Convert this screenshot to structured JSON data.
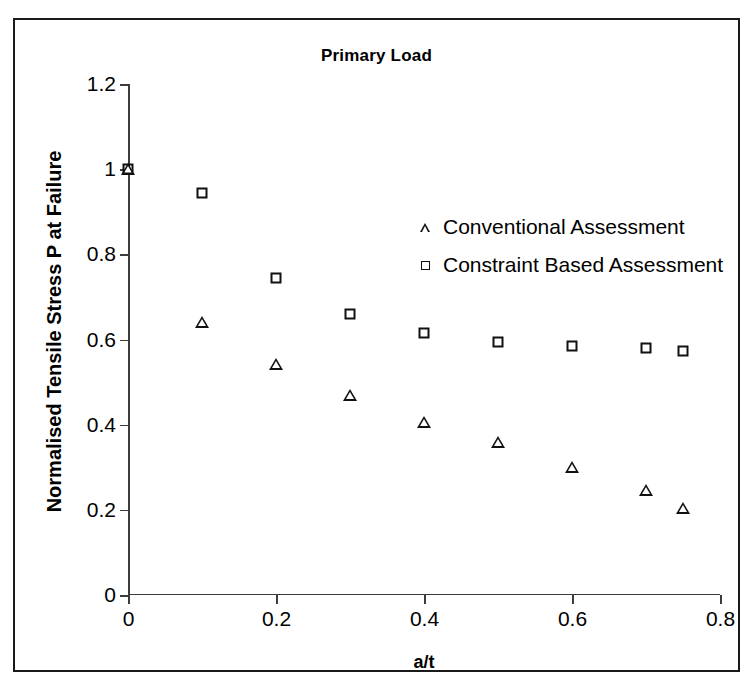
{
  "chart_data": {
    "type": "scatter",
    "title": "Primary Load",
    "xlabel": "a/t",
    "ylabel": "Normalised Tensile Stress P at Failure",
    "xlim": [
      0,
      0.8
    ],
    "ylim": [
      0,
      1.2
    ],
    "xticks": [
      "0",
      "0.2",
      "0.4",
      "0.6",
      "0.8"
    ],
    "xtick_values": [
      0,
      0.2,
      0.4,
      0.6,
      0.8
    ],
    "yticks": [
      "0",
      "0.2",
      "0.4",
      "0.6",
      "0.8",
      "1",
      "1.2"
    ],
    "ytick_values": [
      0,
      0.2,
      0.4,
      0.6,
      0.8,
      1.0,
      1.2
    ],
    "grid": false,
    "legend_position": "upper center inside",
    "series": [
      {
        "name": "Conventional Assessment",
        "marker": "triangle",
        "color": "#111111",
        "x": [
          0,
          0.1,
          0.2,
          0.3,
          0.4,
          0.5,
          0.6,
          0.7,
          0.75
        ],
        "y": [
          1.0,
          0.67,
          0.6,
          0.555,
          0.52,
          0.5,
          0.47,
          0.445,
          0.43
        ]
      },
      {
        "name": "Constraint Based Assessment",
        "marker": "square",
        "color": "#111111",
        "x": [
          0,
          0.1,
          0.2,
          0.3,
          0.4,
          0.5,
          0.6,
          0.7,
          0.75
        ],
        "y": [
          1.0,
          0.945,
          0.745,
          0.66,
          0.615,
          0.595,
          0.585,
          0.58,
          0.572
        ]
      }
    ]
  }
}
